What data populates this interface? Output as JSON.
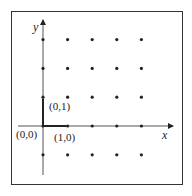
{
  "diagram": {
    "type": "lattice-points",
    "axes": {
      "x_label": "x",
      "y_label": "y"
    },
    "origin_px": [
      43,
      126
    ],
    "spacing_px": [
      24.6,
      28.8
    ],
    "grid_columns": [
      0,
      1,
      2,
      3,
      4
    ],
    "grid_rows": [
      -1,
      0,
      1,
      2,
      3
    ],
    "point_labels": [
      {
        "text": "(0,0)",
        "x": 0,
        "y": 0
      },
      {
        "text": "(1,0)",
        "x": 1,
        "y": 0
      },
      {
        "text": "(0,1)",
        "x": 0,
        "y": 1
      }
    ],
    "basis_vectors": [
      {
        "from": [
          0,
          0
        ],
        "to": [
          1,
          0
        ]
      },
      {
        "from": [
          0,
          0
        ],
        "to": [
          0,
          1
        ]
      }
    ],
    "colors": {
      "ink": "#222222",
      "frame": "#333333",
      "background": "#ffffff"
    }
  }
}
